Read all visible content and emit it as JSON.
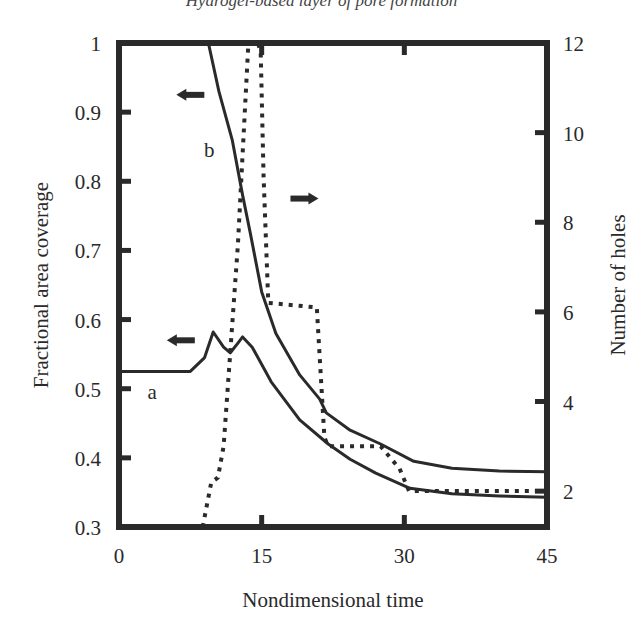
{
  "header_partial_text": "Hydrogel-based layer of pore formation",
  "chart_data": {
    "type": "line",
    "title": "",
    "xlabel": "Nondimensional time",
    "ylabel": "Fractional area coverage",
    "ylabel_right": "Number of holes",
    "xlim": [
      0,
      45
    ],
    "ylim": [
      0.3,
      1.0
    ],
    "ylim_right": [
      1.2,
      12
    ],
    "x_ticks": [
      "0",
      "15",
      "30",
      "45"
    ],
    "y_ticks": [
      "1",
      "0.9",
      "0.8",
      "0.7",
      "0.6",
      "0.5",
      "0.4",
      "0.3"
    ],
    "y_ticks_right": [
      "12",
      "10",
      "8",
      "6",
      "4",
      "2"
    ],
    "grid": false,
    "legend": "none (curves labeled inline 'a' and 'b'; arrows indicate axis)",
    "annotations": [
      {
        "text": "a",
        "x": 3.5,
        "y": 0.495
      },
      {
        "text": "b",
        "x": 9.5,
        "y": 0.845
      },
      {
        "text": "left-arrow (curve b -> left axis)",
        "x": 7.5,
        "y": 0.925
      },
      {
        "text": "left-arrow (curve a -> left axis)",
        "x": 6.5,
        "y": 0.57
      },
      {
        "text": "right-arrow (dotted -> right axis)",
        "x": 19.5,
        "y": 0.775
      }
    ],
    "series": [
      {
        "name": "a",
        "axis": "left",
        "style": "solid",
        "x": [
          0,
          7.5,
          9.0,
          9.9,
          11.0,
          11.7,
          12.5,
          13.0,
          14.0,
          16.0,
          19.0,
          22.0,
          24.3,
          27.0,
          30.6,
          35.0,
          40.0,
          45.0
        ],
        "y": [
          0.525,
          0.525,
          0.545,
          0.582,
          0.56,
          0.552,
          0.566,
          0.575,
          0.56,
          0.51,
          0.455,
          0.42,
          0.398,
          0.378,
          0.356,
          0.348,
          0.345,
          0.343
        ]
      },
      {
        "name": "b",
        "axis": "left",
        "style": "solid",
        "x": [
          9.4,
          10.5,
          11.9,
          13.0,
          13.8,
          15.0,
          16.5,
          19.0,
          21.1,
          21.8,
          24.3,
          27.5,
          31.0,
          35.0,
          40.0,
          45.0
        ],
        "y": [
          1.0,
          0.93,
          0.86,
          0.78,
          0.725,
          0.64,
          0.58,
          0.52,
          0.485,
          0.465,
          0.44,
          0.42,
          0.395,
          0.385,
          0.381,
          0.38
        ]
      },
      {
        "name": "number-of-holes",
        "axis": "right",
        "style": "dotted",
        "x": [
          8.8,
          9.7,
          10.4,
          11.0,
          12.5,
          13.6,
          14.6,
          14.9,
          15.2,
          15.7,
          20.8,
          21.6,
          22.0,
          27.5,
          29.5,
          30.5,
          45.0
        ],
        "y": [
          1.2,
          2.2,
          2.3,
          3.0,
          7.5,
          12.0,
          12.0,
          11.8,
          9.0,
          6.2,
          6.1,
          3.2,
          3.0,
          3.0,
          2.5,
          2.0,
          2.0
        ]
      }
    ]
  }
}
